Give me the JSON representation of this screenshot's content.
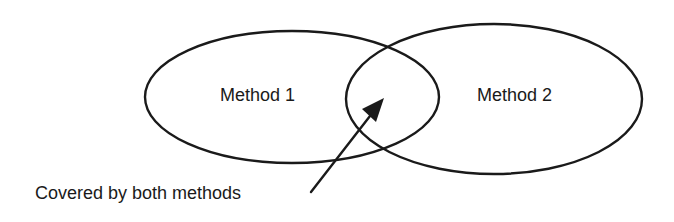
{
  "diagram": {
    "type": "venn",
    "sets": [
      {
        "id": "method-1",
        "label": "Method 1",
        "shape": "ellipse",
        "cx": 292,
        "cy": 97,
        "rx": 147,
        "ry": 66
      },
      {
        "id": "method-2",
        "label": "Method 2",
        "shape": "ellipse",
        "cx": 494,
        "cy": 99,
        "rx": 148,
        "ry": 75
      }
    ],
    "annotation": {
      "text": "Covered by both methods",
      "arrow": {
        "from": [
          311,
          192
        ],
        "to": [
          384,
          98
        ]
      }
    },
    "colors": {
      "stroke": "#1a1a1a",
      "fill": "#ffffff",
      "text": "#1a1a1a",
      "background": "#ffffff"
    }
  }
}
